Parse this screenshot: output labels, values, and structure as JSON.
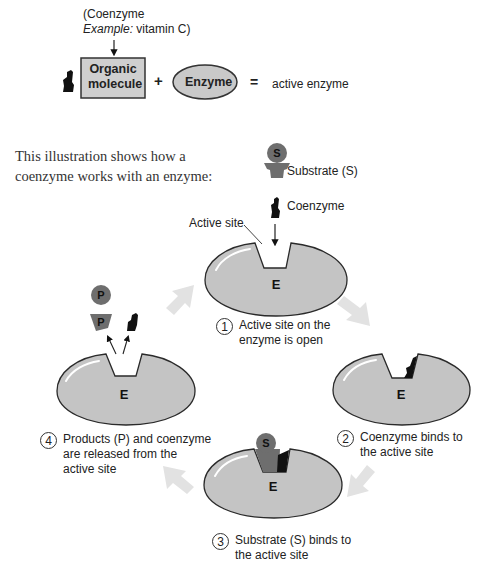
{
  "top_equation": {
    "coenzyme_note_line1": "(Coenzyme",
    "coenzyme_note_example_label": "Example:",
    "coenzyme_note_example_value": " vitamin C)",
    "organic_box_line1": "Organic",
    "organic_box_line2": "molecule",
    "plus": "+",
    "enzyme_label": "Enzyme",
    "equals": "=",
    "result": "active enzyme"
  },
  "intro": {
    "line1": "This illustration shows how a",
    "line2": "coenzyme works with an enzyme:"
  },
  "legend": {
    "substrate_symbol": "S",
    "substrate_label": "Substrate (S)",
    "coenzyme_label": "Coenzyme",
    "active_site_label": "Active site"
  },
  "enzyme_letter": "E",
  "products_symbol": "P",
  "steps": [
    {
      "number": "1",
      "line1": "Active site on the",
      "line2": "enzyme is open"
    },
    {
      "number": "2",
      "line1": "Coenzyme binds to",
      "line2": "the active site"
    },
    {
      "number": "3",
      "line1": "Substrate (S) binds to",
      "line2": "the active site"
    },
    {
      "number": "4",
      "line1": "Products (P) and coenzyme",
      "line2": "are released from the",
      "line3": "active site"
    }
  ],
  "colors": {
    "enzyme_fill": "#c4c4c4",
    "enzyme_stroke": "#2a2a2a",
    "substrate_fill": "#6e6e6e",
    "coenzyme_fill": "#111111",
    "cycle_arrow": "#e2e2e2",
    "box_fill": "#cfcfcf"
  }
}
